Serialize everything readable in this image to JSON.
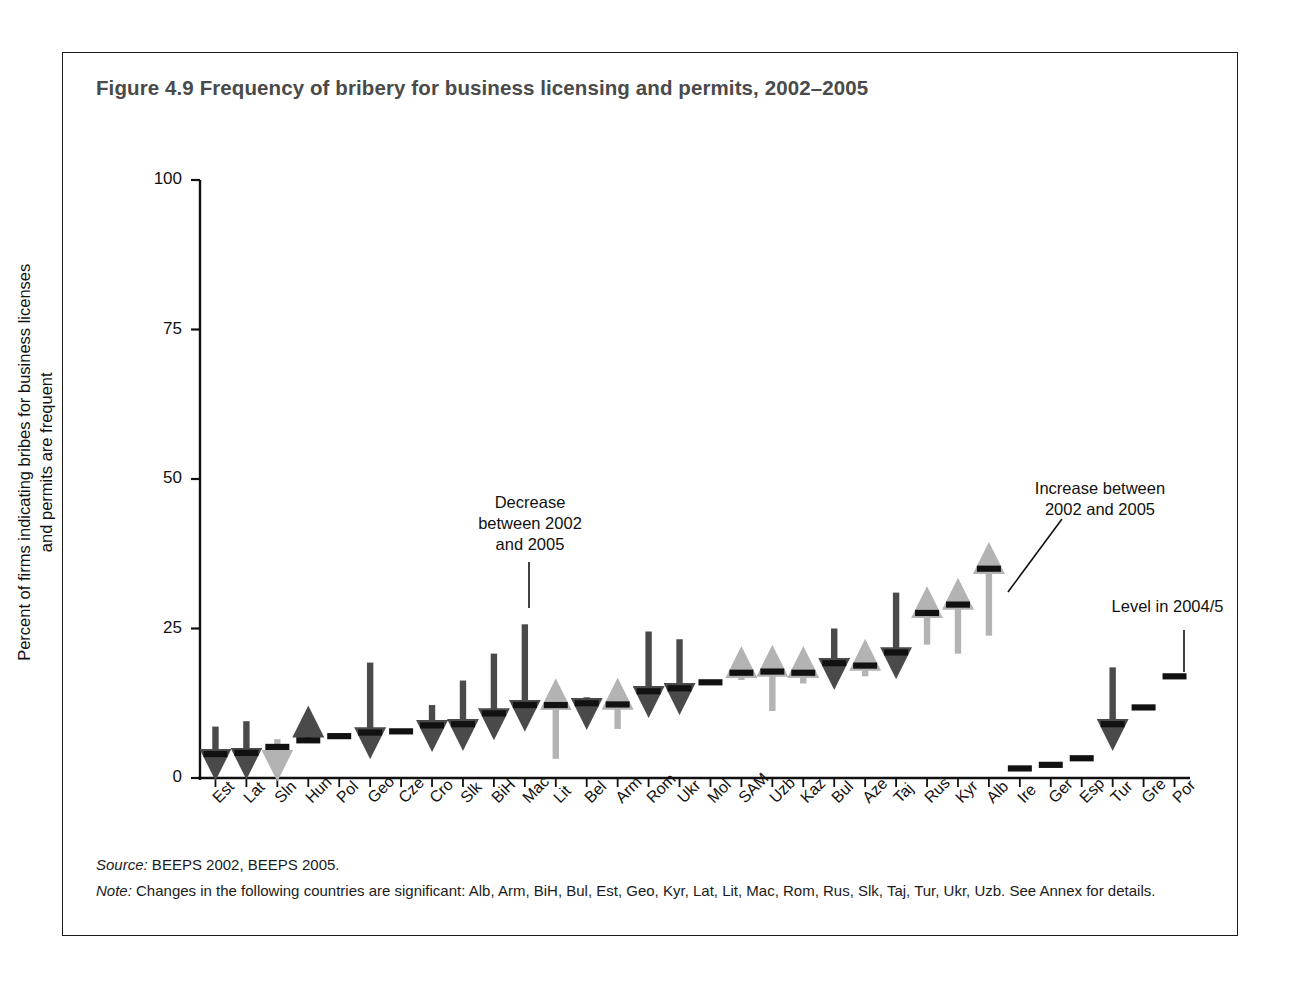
{
  "figure": {
    "title": "Figure 4.9  Frequency of bribery for business licensing and permits, 2002–2005",
    "source_label": "Source:",
    "source_text": " BEEPS 2002, BEEPS 2005.",
    "note_label": "Note:",
    "note_text": " Changes in the following countries are significant: Alb, Arm, BiH, Bul, Est, Geo, Kyr, Lat, Lit, Mac, Rom, Rus, Slk, Taj, Tur, Ukr, Uzb. See Annex for details."
  },
  "annotations": {
    "decrease": "Decrease\nbetween 2002\nand 2005",
    "increase": "Increase between\n2002 and 2005",
    "level": "Level in 2004/5"
  },
  "colors": {
    "decrease_arrow": "#4a4a4a",
    "increase_arrow": "#b3b3b3",
    "level_marker": "#111111",
    "axis": "#111111",
    "title": "#4a4a4a",
    "frame": "#1b1b1b"
  },
  "chart_data": {
    "type": "bar",
    "title": "Frequency of bribery for business licensing and permits, 2002–2005",
    "xlabel": "",
    "ylabel": "Percent of firms indicating bribes for business licenses and permits are frequent",
    "ylim": [
      0,
      100
    ],
    "yticks": [
      0,
      25,
      50,
      75,
      100
    ],
    "ytick_labels": [
      "0",
      "25",
      "50",
      "75",
      "100"
    ],
    "grid": false,
    "legend": "none",
    "categories": [
      "Est",
      "Lat",
      "Sln",
      "Hun",
      "Pol",
      "Geo",
      "Cze",
      "Cro",
      "Slk",
      "BiH",
      "Mac",
      "Lit",
      "Bel",
      "Arm",
      "Rom",
      "Ukr",
      "Mol",
      "SAM",
      "Uzb",
      "Kaz",
      "Bul",
      "Aze",
      "Taj",
      "Rus",
      "Kyr",
      "Alb",
      "Ire",
      "Ger",
      "Esp",
      "Tur",
      "Gre",
      "Por"
    ],
    "series": [
      {
        "name": "Level in 2004/5",
        "values": [
          4.0,
          4.2,
          5.2,
          6.3,
          7.0,
          7.6,
          7.8,
          8.8,
          9.0,
          10.8,
          12.2,
          12.2,
          12.5,
          12.3,
          14.5,
          15.0,
          16.0,
          17.6,
          17.8,
          17.6,
          19.2,
          18.8,
          21.0,
          27.6,
          29.0,
          35.0,
          1.6,
          2.2,
          3.3,
          9.0,
          11.8,
          17.0
        ]
      },
      {
        "name": "Level in 2002",
        "values": [
          8.6,
          9.5,
          6.5,
          6.0,
          null,
          19.3,
          null,
          12.2,
          16.3,
          20.8,
          25.7,
          3.2,
          13.5,
          8.2,
          24.5,
          23.2,
          null,
          16.4,
          11.2,
          15.8,
          25.0,
          17.0,
          31.0,
          22.3,
          20.8,
          23.8,
          null,
          null,
          null,
          18.5,
          null,
          null
        ]
      }
    ],
    "changes": [
      "decrease",
      "decrease",
      "increase",
      "decrease",
      "none",
      "decrease",
      "none",
      "decrease",
      "decrease",
      "decrease",
      "decrease",
      "increase",
      "decrease",
      "increase",
      "decrease",
      "decrease",
      "none",
      "increase",
      "increase",
      "increase",
      "decrease",
      "increase",
      "decrease",
      "increase",
      "increase",
      "increase",
      "none",
      "none",
      "none",
      "decrease",
      "none",
      "none"
    ]
  }
}
